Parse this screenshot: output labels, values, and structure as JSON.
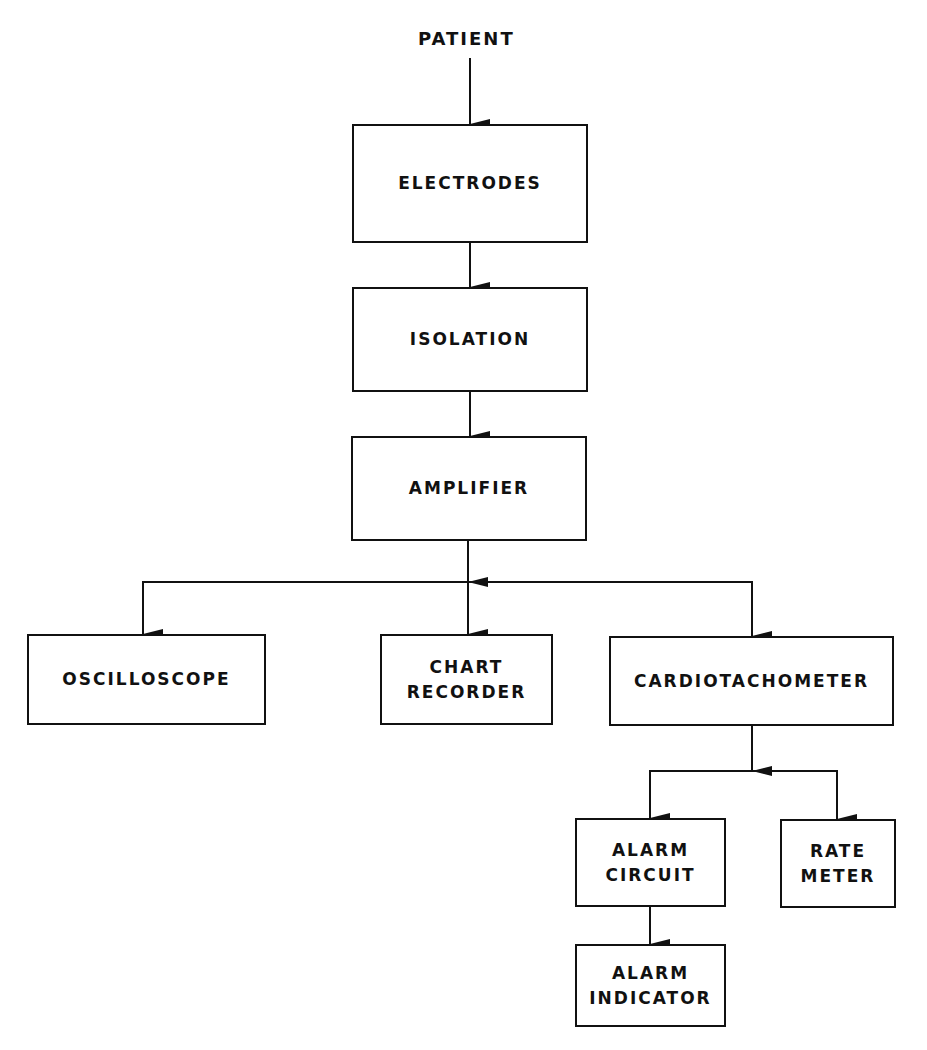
{
  "diagram": {
    "type": "block-diagram",
    "source_label": "PATIENT",
    "blocks": {
      "electrodes": {
        "lines": [
          "ELECTRODES"
        ]
      },
      "isolation": {
        "lines": [
          "ISOLATION"
        ]
      },
      "amplifier": {
        "lines": [
          "AMPLIFIER"
        ]
      },
      "oscilloscope": {
        "lines": [
          "OSCILLOSCOPE"
        ]
      },
      "chart_recorder": {
        "lines": [
          "CHART",
          "RECORDER"
        ]
      },
      "cardiotachometer": {
        "lines": [
          "CARDIOTACHOMETER"
        ]
      },
      "alarm_circuit": {
        "lines": [
          "ALARM",
          "CIRCUIT"
        ]
      },
      "rate_meter": {
        "lines": [
          "RATE",
          "METER"
        ]
      },
      "alarm_indicator": {
        "lines": [
          "ALARM",
          "INDICATOR"
        ]
      }
    },
    "connections": [
      [
        "PATIENT",
        "ELECTRODES"
      ],
      [
        "ELECTRODES",
        "ISOLATION"
      ],
      [
        "ISOLATION",
        "AMPLIFIER"
      ],
      [
        "AMPLIFIER",
        "OSCILLOSCOPE"
      ],
      [
        "AMPLIFIER",
        "CHART RECORDER"
      ],
      [
        "AMPLIFIER",
        "CARDIOTACHOMETER"
      ],
      [
        "CARDIOTACHOMETER",
        "ALARM CIRCUIT"
      ],
      [
        "CARDIOTACHOMETER",
        "RATE METER"
      ],
      [
        "ALARM CIRCUIT",
        "ALARM INDICATOR"
      ]
    ],
    "colors": {
      "line": "#111111",
      "background": "#ffffff"
    }
  }
}
